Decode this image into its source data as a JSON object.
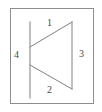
{
  "figure": {
    "title": "",
    "type": "line-diagram",
    "background_color": "#ffffff",
    "stroke_color": "#808080",
    "border_color": "#8c8c8c",
    "label_color": "#4a4a4a"
  },
  "frame": {
    "name": "outer-rectangle",
    "x": 10,
    "y": 8,
    "width": 84,
    "height": 96
  },
  "shape": {
    "description": "bowtie outline formed by two vertical segments and two diagonal segments",
    "vertices": {
      "left_top": [
        30,
        22
      ],
      "left_mid_upper": [
        30,
        47
      ],
      "left_mid_lower": [
        30,
        65
      ],
      "left_bottom": [
        30,
        98
      ],
      "right_top": [
        72,
        22
      ],
      "right_bottom": [
        72,
        89
      ]
    },
    "segments": [
      {
        "name": "segment-1",
        "from": [
          30,
          47
        ],
        "to": [
          72,
          22
        ],
        "label": "1"
      },
      {
        "name": "segment-2",
        "from": [
          30,
          65
        ],
        "to": [
          72,
          89
        ],
        "label": "2"
      },
      {
        "name": "segment-3",
        "from": [
          72,
          22
        ],
        "to": [
          72,
          89
        ],
        "label": "3"
      },
      {
        "name": "segment-4",
        "from": [
          30,
          22
        ],
        "to": [
          30,
          98
        ],
        "label": "4"
      }
    ]
  },
  "labels": {
    "top": "1",
    "bottom": "2",
    "right": "3",
    "left": "4"
  }
}
